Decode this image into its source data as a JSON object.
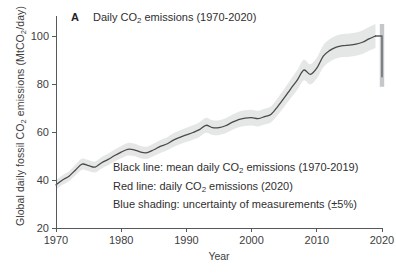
{
  "figure": {
    "panel_letter": "A",
    "panel_title_prefix": "Daily CO",
    "panel_title_sub": "2",
    "panel_title_suffix": " emissions (1970-2020)",
    "cut_off_title": "annual global fossil CO2 emissions",
    "background_color": "#ffffff",
    "line_color": "#4a4a4a",
    "band_color": "#e4e6e6",
    "red_line_color": "#5b5b5b",
    "axis_color": "#55595c"
  },
  "axes": {
    "y_label_part1": "Global daily fossil CO",
    "y_label_sub1": "2",
    "y_label_part2": " emissions (MtCO",
    "y_label_sub2": "2",
    "y_label_part3": "/day)",
    "x_label": "Year",
    "y_ticks": [
      "20",
      "40",
      "60",
      "80",
      "100"
    ],
    "x_ticks": [
      "1970",
      "1980",
      "1990",
      "2000",
      "2010",
      "2020"
    ]
  },
  "legend": {
    "line1_a": "Black line: mean daily CO",
    "line1_sub": "2",
    "line1_b": " emissions (1970-2019)",
    "line2_a": "Red line: daily CO",
    "line2_sub": "2",
    "line2_b": " emissions (2020)",
    "line3": "Blue shading: uncertainty of measurements (±5%)"
  },
  "chart_data": {
    "type": "line",
    "title": "Daily CO2 emissions (1970-2020)",
    "xlabel": "Year",
    "ylabel": "Global daily fossil CO2 emissions (MtCO2/day)",
    "xlim": [
      1970,
      2020
    ],
    "ylim": [
      20,
      105
    ],
    "grid": false,
    "legend_position": "inside-center",
    "uncertainty_pct": 5,
    "x": [
      1970,
      1971,
      1972,
      1973,
      1974,
      1975,
      1976,
      1977,
      1978,
      1979,
      1980,
      1981,
      1982,
      1983,
      1984,
      1985,
      1986,
      1987,
      1988,
      1989,
      1990,
      1991,
      1992,
      1993,
      1994,
      1995,
      1996,
      1997,
      1998,
      1999,
      2000,
      2001,
      2002,
      2003,
      2004,
      2005,
      2006,
      2007,
      2008,
      2009,
      2010,
      2011,
      2012,
      2013,
      2014,
      2015,
      2016,
      2017,
      2018,
      2019
    ],
    "series": [
      {
        "name": "mean daily CO2 emissions (1970-2019)",
        "color": "#4a4a4a",
        "values": [
          38.0,
          40.0,
          41.6,
          44.2,
          46.6,
          46.0,
          45.4,
          47.2,
          48.6,
          50.2,
          51.6,
          52.8,
          52.6,
          51.6,
          51.4,
          52.6,
          54.0,
          55.0,
          56.6,
          57.8,
          58.8,
          59.8,
          61.0,
          62.8,
          61.8,
          61.8,
          62.6,
          64.0,
          65.2,
          65.8,
          66.0,
          65.6,
          66.4,
          67.4,
          70.6,
          74.2,
          78.0,
          81.6,
          85.8,
          84.0,
          86.6,
          91.6,
          94.0,
          95.4,
          96.0,
          96.2,
          96.6,
          97.4,
          98.8,
          100.0
        ]
      },
      {
        "name": "daily CO2 emissions (2020)",
        "color": "#5b5b5b",
        "x": [
          2020
        ],
        "values": [
          83.0
        ],
        "note": "vertical drop at 2020 from 100.0 to 83.0"
      }
    ]
  }
}
